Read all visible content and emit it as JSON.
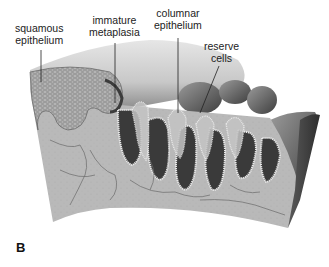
{
  "figure": {
    "panel_letter": "B",
    "labels": [
      {
        "id": "squamous",
        "lines": [
          "squamous",
          "epithelium"
        ]
      },
      {
        "id": "immature",
        "lines": [
          "immature",
          "metaplasia"
        ]
      },
      {
        "id": "columnar",
        "lines": [
          "columnar",
          "epithelium"
        ]
      },
      {
        "id": "reserve",
        "lines": [
          "reserve",
          "cells"
        ]
      }
    ],
    "colors": {
      "background": "#ffffff",
      "stroma": "#b8b8b8",
      "stroma_vessels": "#6a6a6a",
      "surface_light": "#d8d8d8",
      "surface_dark": "#4a4a4a",
      "squamous": "#9a9a9a",
      "crypt_dark": "#3a3a3a",
      "columnar_border": "#e8e8e8",
      "text": "#222222"
    }
  }
}
